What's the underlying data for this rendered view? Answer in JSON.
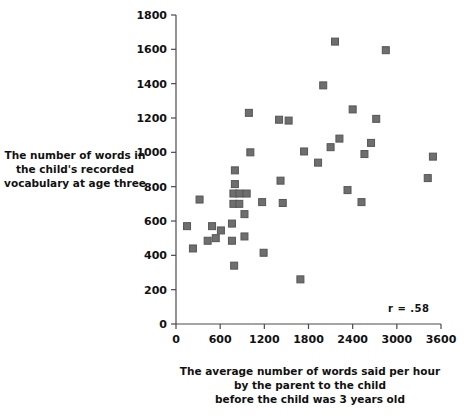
{
  "chart_data": {
    "type": "scatter",
    "title": "",
    "xlabel": "The average number of words said per hour by the parent to the child before the child was 3 years old",
    "ylabel": "The number of words in the child's recorded vocabulary at age three",
    "xlim": [
      0,
      3600
    ],
    "ylim": [
      0,
      1800
    ],
    "xticks": [
      0,
      600,
      1200,
      1800,
      2400,
      3000,
      3600
    ],
    "yticks": [
      0,
      200,
      400,
      600,
      800,
      1000,
      1200,
      1400,
      1600,
      1800
    ],
    "grid": false,
    "legend": "none",
    "annotation": "r = .58",
    "correlation": 0.58,
    "marker": {
      "shape": "square",
      "color": "#6e6e6e",
      "edge_color": "#565656",
      "size": 7
    },
    "points": [
      {
        "x": 150,
        "y": 570
      },
      {
        "x": 230,
        "y": 440
      },
      {
        "x": 320,
        "y": 725
      },
      {
        "x": 430,
        "y": 485
      },
      {
        "x": 490,
        "y": 570
      },
      {
        "x": 540,
        "y": 500
      },
      {
        "x": 610,
        "y": 545
      },
      {
        "x": 760,
        "y": 485
      },
      {
        "x": 760,
        "y": 585
      },
      {
        "x": 790,
        "y": 340
      },
      {
        "x": 800,
        "y": 895
      },
      {
        "x": 800,
        "y": 815
      },
      {
        "x": 780,
        "y": 760
      },
      {
        "x": 860,
        "y": 760
      },
      {
        "x": 780,
        "y": 700
      },
      {
        "x": 860,
        "y": 700
      },
      {
        "x": 960,
        "y": 760
      },
      {
        "x": 930,
        "y": 640
      },
      {
        "x": 930,
        "y": 510
      },
      {
        "x": 1010,
        "y": 1000
      },
      {
        "x": 990,
        "y": 1230
      },
      {
        "x": 1190,
        "y": 415
      },
      {
        "x": 1170,
        "y": 710
      },
      {
        "x": 1400,
        "y": 1190
      },
      {
        "x": 1420,
        "y": 835
      },
      {
        "x": 1450,
        "y": 705
      },
      {
        "x": 1530,
        "y": 1185
      },
      {
        "x": 1690,
        "y": 260
      },
      {
        "x": 1740,
        "y": 1005
      },
      {
        "x": 1930,
        "y": 940
      },
      {
        "x": 2000,
        "y": 1390
      },
      {
        "x": 2100,
        "y": 1030
      },
      {
        "x": 2160,
        "y": 1645
      },
      {
        "x": 2220,
        "y": 1080
      },
      {
        "x": 2330,
        "y": 780
      },
      {
        "x": 2400,
        "y": 1250
      },
      {
        "x": 2520,
        "y": 710
      },
      {
        "x": 2560,
        "y": 990
      },
      {
        "x": 2650,
        "y": 1055
      },
      {
        "x": 2720,
        "y": 1195
      },
      {
        "x": 2850,
        "y": 1595
      },
      {
        "x": 3420,
        "y": 850
      },
      {
        "x": 3490,
        "y": 975
      }
    ]
  },
  "labels": {
    "ylabel_lines": [
      "The number of words in",
      "the child's recorded",
      "vocabulary at age three"
    ],
    "xlabel_lines": [
      "The average number of words said per hour",
      "by the parent to the child",
      "before the child was 3 years old"
    ],
    "annotation": "r = .58"
  }
}
